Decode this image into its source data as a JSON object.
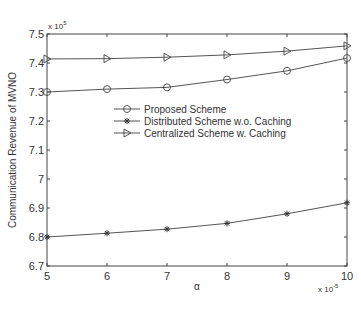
{
  "chart_data": {
    "type": "line",
    "title": "",
    "xlabel": "α",
    "ylabel": "Communication Revenue of MVNO",
    "x_multiplier_label": "x 10",
    "x_multiplier_exp": "-5",
    "y_multiplier_label": "x 10",
    "y_multiplier_exp": "5",
    "x": [
      5,
      6,
      7,
      8,
      9,
      10
    ],
    "xlim": [
      5,
      10
    ],
    "ylim": [
      6.7,
      7.5
    ],
    "xticks": [
      "5",
      "6",
      "7",
      "8",
      "9",
      "10"
    ],
    "yticks": [
      "6.7",
      "6.8",
      "6.9",
      "7",
      "7.1",
      "7.2",
      "7.3",
      "7.4",
      "7.5"
    ],
    "ytick_values": [
      6.7,
      6.8,
      6.9,
      7.0,
      7.1,
      7.2,
      7.3,
      7.4,
      7.5
    ],
    "grid": false,
    "legend_position": "inside-center",
    "series": [
      {
        "name": "Proposed Scheme",
        "marker": "circle",
        "values": [
          7.3,
          7.31,
          7.316,
          7.343,
          7.373,
          7.417
        ]
      },
      {
        "name": "Distributed Scheme w.o. Caching",
        "marker": "star",
        "values": [
          6.8,
          6.813,
          6.827,
          6.847,
          6.88,
          6.918
        ]
      },
      {
        "name": "Centralized Scheme w. Caching",
        "marker": "triangle-right",
        "values": [
          7.414,
          7.415,
          7.42,
          7.428,
          7.441,
          7.459
        ]
      }
    ]
  }
}
